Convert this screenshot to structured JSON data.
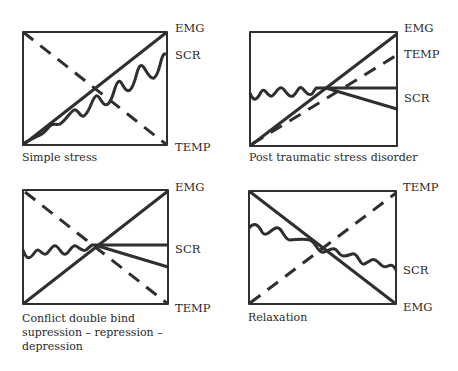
{
  "stroke_color": "#2f2f2f",
  "panels": [
    {
      "caption": "Simple stress",
      "labels": {
        "top": "EMG",
        "mid": "SCR",
        "bottom": "TEMP"
      },
      "lines": {
        "EMG": "solid line rising from bottom-left to top-right",
        "SCR": "wavy line rising with increasing amplitude",
        "TEMP": "dashed line falling from top-left to bottom-right"
      }
    },
    {
      "caption": "Post traumatic stress disorder",
      "labels": {
        "top": "EMG",
        "mid": "TEMP",
        "bottom": "SCR"
      },
      "lines": {
        "EMG": "solid line rising from bottom-left to top-right",
        "TEMP": "dashed line rising, ending below EMG",
        "SCR": "wavy then flat, splitting into horizontal and declining branches"
      }
    },
    {
      "caption_lines": [
        "Conflict double bind",
        "supression – repression –",
        "depression"
      ],
      "labels": {
        "top": "EMG",
        "mid": "SCR",
        "bottom": "TEMP"
      },
      "lines": {
        "EMG": "solid line rising from bottom-left to top-right",
        "SCR": "wavy then flat, splitting into horizontal and declining branches",
        "TEMP": "dashed line falling from top-left to bottom-right"
      }
    },
    {
      "caption": "Relaxation",
      "labels": {
        "top": "TEMP",
        "mid": "SCR",
        "bottom": "EMG"
      },
      "lines": {
        "TEMP": "dashed line rising from bottom-left to top-right",
        "EMG": "solid line falling from top-left to bottom-right",
        "SCR": "wavy line gradually declining"
      }
    }
  ]
}
